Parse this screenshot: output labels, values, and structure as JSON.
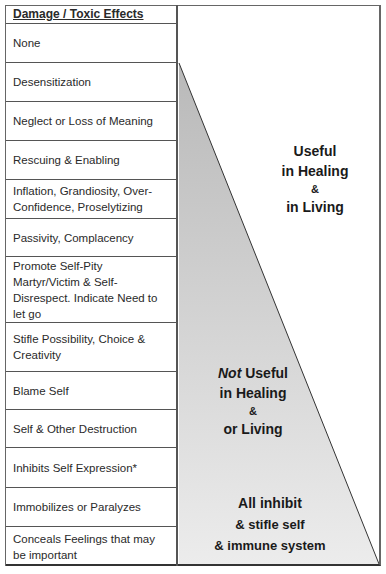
{
  "table": {
    "header": "Damage / Toxic Effects",
    "rows": [
      {
        "label": "None"
      },
      {
        "label": "Desensitization"
      },
      {
        "label": "Neglect or Loss of Meaning"
      },
      {
        "label": "Rescuing & Enabling"
      },
      {
        "label": "Inflation, Grandiosity, Over-Confidence, Proselytizing"
      },
      {
        "label": "Passivity, Complacency"
      },
      {
        "label": "Promote Self-Pity Martyr/Victim & Self-Disrespect. Indicate Need to let go"
      },
      {
        "label": "Stifle Possibility, Choice & Creativity"
      },
      {
        "label": "Blame Self"
      },
      {
        "label": "Self & Other Destruction"
      },
      {
        "label": "Inhibits Self Expression*"
      },
      {
        "label": "Immobilizes or Paralyzes"
      },
      {
        "label": "Conceals Feelings that may be important"
      }
    ]
  },
  "annotations": {
    "useful": {
      "line1": "Useful",
      "line2": "in Healing",
      "amp": "&",
      "line3": "in Living"
    },
    "not_useful": {
      "not": "Not",
      "line1_rest": " Useful",
      "line2": "in Healing",
      "amp": "&",
      "line3": "or Living"
    },
    "inhibit": {
      "line1": "All inhibit",
      "line2": "& stifle self",
      "line3": "& immune system"
    }
  },
  "colors": {
    "triangle_fill_top": "#b9b9b9",
    "triangle_fill_bottom": "#ececec",
    "border": "#555555"
  }
}
